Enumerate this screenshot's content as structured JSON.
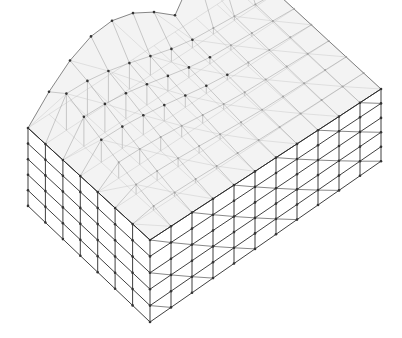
{
  "figure": {
    "title": "",
    "colors": {
      "background": "#ffffff",
      "members_dark": "#2a2a2a",
      "members_light": "#9a9a9a",
      "nodes": "#333333"
    },
    "lattice": {
      "bays_long_side": 11,
      "bays_short_side": 7,
      "storeys": 5,
      "roof": "wavy, rising toward the back-left with a crest along the rear edge"
    }
  }
}
